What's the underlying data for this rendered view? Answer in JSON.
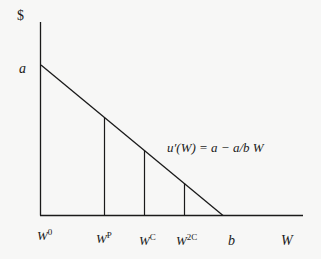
{
  "diagram": {
    "type": "marginal utility diagram",
    "y_axis_label": "$",
    "x_axis_label": "W",
    "y_intercept_label": "a",
    "x_intercept_label": "b",
    "curve_equation": "u′(W) = a − a/b W",
    "x_ticks": [
      {
        "base": "W",
        "sup": "0"
      },
      {
        "base": "W",
        "sup": "P"
      },
      {
        "base": "W",
        "sup": "C"
      },
      {
        "base": "W",
        "sup": "2C"
      }
    ],
    "colors": {
      "line": "#1a1a1a",
      "background": "#f7f7f6"
    }
  }
}
